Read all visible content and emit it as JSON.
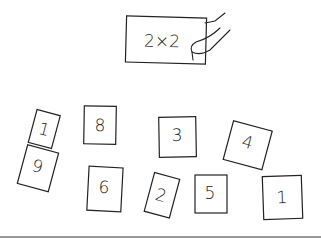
{
  "target_card": {
    "label": "2×2",
    "icon": "hand-holding-card"
  },
  "cards": [
    {
      "label": "1"
    },
    {
      "label": "8"
    },
    {
      "label": "3"
    },
    {
      "label": "4"
    },
    {
      "label": "9"
    },
    {
      "label": "6"
    },
    {
      "label": "2"
    },
    {
      "label": "5"
    },
    {
      "label": "1"
    }
  ]
}
